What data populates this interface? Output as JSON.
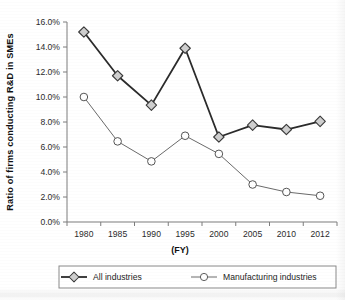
{
  "chart_data": {
    "type": "line",
    "title": "",
    "xlabel": "(FY)",
    "ylabel": "Ratio of firms conducting R&D in SMEs",
    "categories": [
      "1980",
      "1985",
      "1990",
      "1995",
      "2000",
      "2005",
      "2010",
      "2012"
    ],
    "ylim": [
      0,
      16
    ],
    "ytick_values": [
      0,
      2,
      4,
      6,
      8,
      10,
      12,
      14,
      16
    ],
    "ytick_labels": [
      "0.0%",
      "2.0%",
      "4.0%",
      "6.0%",
      "8.0%",
      "10.0%",
      "12.0%",
      "14.0%",
      "16.0%"
    ],
    "grid": false,
    "legend_position": "bottom",
    "series": [
      {
        "name": "All industries",
        "marker": "diamond",
        "marker_fill": "#cfcfcf",
        "marker_stroke": "#3a3a3a",
        "line_color": "#2b2b2b",
        "line_width": 1.8,
        "values": [
          15.2,
          11.7,
          9.35,
          13.9,
          6.8,
          7.75,
          7.4,
          8.05
        ]
      },
      {
        "name": "Manufacturing industries",
        "marker": "circle",
        "marker_fill": "#ffffff",
        "marker_stroke": "#555555",
        "line_color": "#6a6a6a",
        "line_width": 1.0,
        "values": [
          10.0,
          6.45,
          4.85,
          6.9,
          5.45,
          3.0,
          2.4,
          2.1
        ]
      }
    ]
  },
  "legend": {
    "items": [
      {
        "label": "All industries",
        "marker": "diamond-marker"
      },
      {
        "label": "Manufacturing industries",
        "marker": "circle-marker"
      }
    ]
  },
  "colors": {
    "axis": "#7d7d7d",
    "text": "#1a1a1a",
    "all_industries_line": "#2b2b2b",
    "manufacturing_line": "#6a6a6a",
    "diamond_fill": "#cfcfcf",
    "circle_fill": "#ffffff",
    "background": "#ffffff"
  }
}
